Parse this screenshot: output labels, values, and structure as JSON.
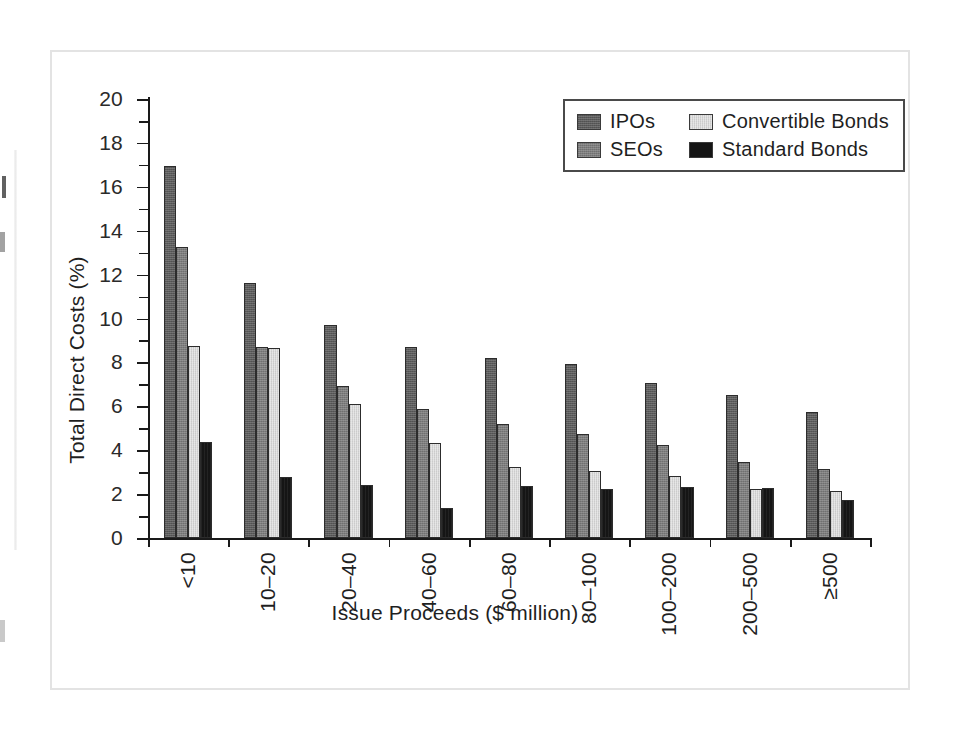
{
  "figure": {
    "background_color": "#ffffff",
    "frame_color": "#e3e3e3"
  },
  "chart_data": {
    "type": "bar",
    "title": "",
    "xlabel": "Issue Proceeds ($ million)",
    "ylabel": "Total Direct Costs (%)",
    "categories": [
      "<10",
      "10–20",
      "20–40",
      "40–60",
      "60–80",
      "80–100",
      "100–200",
      "200–500",
      "≥500"
    ],
    "series": [
      {
        "name": "IPOs",
        "color": "#5b5b5b",
        "values": [
          16.96,
          11.63,
          9.7,
          8.72,
          8.2,
          7.91,
          7.06,
          6.53,
          5.72
        ]
      },
      {
        "name": "SEOs",
        "color": "#7d7d7d",
        "values": [
          13.28,
          8.72,
          6.93,
          5.87,
          5.18,
          4.73,
          4.22,
          3.47,
          3.15
        ]
      },
      {
        "name": "Convertible Bonds",
        "color": "#e2e2e2",
        "values": [
          8.75,
          8.67,
          6.1,
          4.31,
          3.25,
          3.06,
          2.82,
          2.22,
          2.14
        ]
      },
      {
        "name": "Standard Bonds",
        "color": "#151515",
        "values": [
          4.39,
          2.76,
          2.42,
          1.38,
          2.37,
          2.23,
          2.31,
          2.26,
          1.72
        ]
      }
    ],
    "ylim": [
      0,
      20
    ],
    "yticks": [
      0,
      2,
      4,
      6,
      8,
      10,
      12,
      14,
      16,
      18,
      20
    ],
    "ytick_labels": [
      "0",
      "2",
      "4",
      "6",
      "8",
      "10",
      "12",
      "14",
      "16",
      "18",
      "20"
    ],
    "yminor_step": 1,
    "grid": false,
    "legend_position": "top-right",
    "legend_entries": [
      "IPOs",
      "Convertible Bonds",
      "SEOs",
      "Standard Bonds"
    ],
    "xtick_rotation": 90
  }
}
